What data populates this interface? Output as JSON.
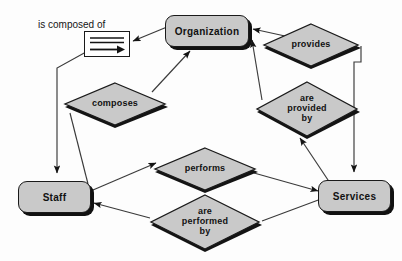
{
  "diagram": {
    "type": "entity-relationship-diagram",
    "background_color": "#fdfdfd",
    "node_fill_color": "#c9c9c9",
    "line_color": "#1a1a1a",
    "entities": [
      {
        "id": "organization",
        "label": "Organization",
        "x": 165,
        "y": 15,
        "w": 84,
        "h": 32
      },
      {
        "id": "staff",
        "label": "Staff",
        "x": 18,
        "y": 181,
        "w": 73,
        "h": 32
      },
      {
        "id": "services",
        "label": "Services",
        "x": 318,
        "y": 180,
        "w": 73,
        "h": 32
      }
    ],
    "relationships": [
      {
        "id": "composes",
        "label": "composes",
        "cx": 115,
        "cy": 103,
        "rx": 53,
        "ry": 22
      },
      {
        "id": "provides",
        "label": "provides",
        "cx": 311,
        "cy": 44,
        "rx": 50,
        "ry": 22
      },
      {
        "id": "are-provided-by",
        "label": "are\nprovided\nby",
        "cx": 307,
        "cy": 108,
        "rx": 53,
        "ry": 28
      },
      {
        "id": "performs",
        "label": "performs",
        "cx": 205,
        "cy": 168,
        "rx": 53,
        "ry": 22
      },
      {
        "id": "are-performed-by",
        "label": "are\nperformed\nby",
        "cx": 205,
        "cy": 221,
        "rx": 57,
        "ry": 28
      }
    ],
    "legend": {
      "caption": "is composed of",
      "caption_x": 38,
      "caption_y": 19,
      "box_x": 84,
      "box_y": 31,
      "box_w": 46,
      "box_h": 26,
      "icon_name": "aggregation-arrow-icon"
    }
  }
}
